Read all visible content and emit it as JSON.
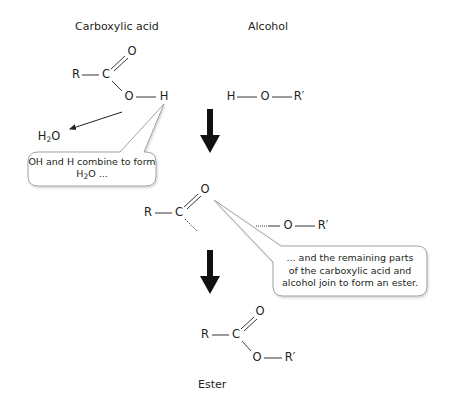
{
  "headings": {
    "carboxylic_acid": "Carboxylic acid",
    "alcohol": "Alcohol",
    "ester": "Ester"
  },
  "reactants": {
    "acid": {
      "r": "R",
      "c": "C",
      "o_double": "O",
      "o_single": "O",
      "h": "H"
    },
    "alcohol": {
      "h": "H",
      "o": "O",
      "r_prime": "R′"
    }
  },
  "byproduct": {
    "h": "H",
    "sub": "2",
    "o": "O"
  },
  "intermediate": {
    "acyl": {
      "r": "R",
      "c": "C",
      "o_double": "O"
    },
    "alkoxy": {
      "o": "O",
      "r_prime": "R′"
    }
  },
  "product": {
    "r": "R",
    "c": "C",
    "o_double": "O",
    "o_single": "O",
    "r_prime": "R′"
  },
  "callouts": {
    "first": {
      "line1": "OH and H combine to form",
      "line2_h": "H",
      "line2_sub": "2",
      "line2_rest": "O ..."
    },
    "second": {
      "line1": "... and the remaining parts",
      "line2": "of the carboxylic acid and",
      "line3": "alcohol join to form an ester."
    }
  },
  "colors": {
    "ink": "#231f20",
    "bubble_border": "#8c8c8c",
    "bubble_fill": "#ffffff",
    "arrow": "#111111"
  }
}
